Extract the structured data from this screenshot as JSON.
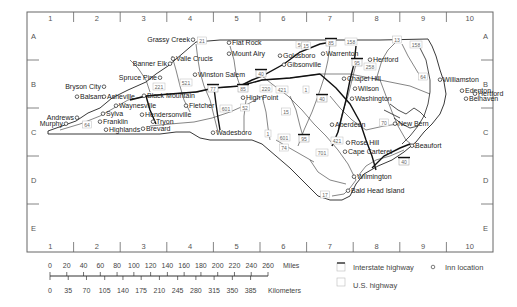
{
  "map": {
    "title": "North Carolina inn locations",
    "columns": [
      "1",
      "2",
      "3",
      "4",
      "5",
      "6",
      "7",
      "8",
      "9",
      "10"
    ],
    "rows": [
      "A",
      "B",
      "C",
      "D",
      "E"
    ],
    "places": [
      {
        "name": "Grassy Creek",
        "x": 190,
        "y": 42,
        "anchor": "end"
      },
      {
        "name": "Flat Rock",
        "x": 232,
        "y": 45,
        "anchor": "start"
      },
      {
        "name": "Mount Airy",
        "x": 232,
        "y": 56,
        "anchor": "start"
      },
      {
        "name": "Valle Crucis",
        "x": 176,
        "y": 61,
        "anchor": "start"
      },
      {
        "name": "Banner Elk",
        "x": 167,
        "y": 66,
        "anchor": "end"
      },
      {
        "name": "Goldsboro",
        "x": 283,
        "y": 58,
        "anchor": "start"
      },
      {
        "name": "Gibsonville",
        "x": 287,
        "y": 67,
        "anchor": "start"
      },
      {
        "name": "Warrenton",
        "x": 326,
        "y": 56,
        "anchor": "start"
      },
      {
        "name": "Hertford",
        "x": 373,
        "y": 62,
        "anchor": "start"
      },
      {
        "name": "Spruce Pine",
        "x": 157,
        "y": 80,
        "anchor": "end"
      },
      {
        "name": "Winston Salem",
        "x": 198,
        "y": 77,
        "anchor": "start"
      },
      {
        "name": "Chapel Hill",
        "x": 347,
        "y": 81,
        "anchor": "start"
      },
      {
        "name": "Williamston",
        "x": 443,
        "y": 82,
        "anchor": "start"
      },
      {
        "name": "Bryson City",
        "x": 101,
        "y": 89,
        "anchor": "end"
      },
      {
        "name": "Wilson",
        "x": 358,
        "y": 91,
        "anchor": "start"
      },
      {
        "name": "Balsam",
        "x": 80,
        "y": 99,
        "anchor": "start"
      },
      {
        "name": "Asheville",
        "x": 107,
        "y": 99,
        "anchor": "start"
      },
      {
        "name": "Black Mountain",
        "x": 147,
        "y": 98,
        "anchor": "start"
      },
      {
        "name": "High Point",
        "x": 246,
        "y": 100,
        "anchor": "start"
      },
      {
        "name": "Edenton",
        "x": 465,
        "y": 93,
        "anchor": "start"
      },
      {
        "name": "Hertford",
        "x": 478,
        "y": 96,
        "anchor": "start"
      },
      {
        "name": "Washington",
        "x": 355,
        "y": 101,
        "anchor": "start"
      },
      {
        "name": "Belhaven",
        "x": 469,
        "y": 101,
        "anchor": "start"
      },
      {
        "name": "Waynesville",
        "x": 119,
        "y": 108,
        "anchor": "start"
      },
      {
        "name": "Fletcher",
        "x": 189,
        "y": 108,
        "anchor": "start"
      },
      {
        "name": "Sylva",
        "x": 106,
        "y": 116,
        "anchor": "start"
      },
      {
        "name": "Hendersonville",
        "x": 145,
        "y": 117,
        "anchor": "start"
      },
      {
        "name": "Andrews",
        "x": 74,
        "y": 120,
        "anchor": "end"
      },
      {
        "name": "Franklin",
        "x": 103,
        "y": 124,
        "anchor": "start"
      },
      {
        "name": "Tryon",
        "x": 156,
        "y": 124,
        "anchor": "start"
      },
      {
        "name": "Murphy",
        "x": 63,
        "y": 126,
        "anchor": "end"
      },
      {
        "name": "Highlands",
        "x": 109,
        "y": 132,
        "anchor": "start"
      },
      {
        "name": "Brevard",
        "x": 146,
        "y": 131,
        "anchor": "start"
      },
      {
        "name": "Wadesboro",
        "x": 216,
        "y": 135,
        "anchor": "start"
      },
      {
        "name": "Aberdeen",
        "x": 335,
        "y": 127,
        "anchor": "start"
      },
      {
        "name": "New Bern",
        "x": 398,
        "y": 126,
        "anchor": "start"
      },
      {
        "name": "Rose Hill",
        "x": 351,
        "y": 145,
        "anchor": "start"
      },
      {
        "name": "Beaufort",
        "x": 415,
        "y": 148,
        "anchor": "start"
      },
      {
        "name": "Cape Carteret",
        "x": 348,
        "y": 154,
        "anchor": "start"
      },
      {
        "name": "Wilmington",
        "x": 357,
        "y": 179,
        "anchor": "start"
      },
      {
        "name": "Bald Head Island",
        "x": 351,
        "y": 193,
        "anchor": "start"
      }
    ],
    "us_highways": [
      {
        "num": "21",
        "x": 202,
        "y": 41
      },
      {
        "num": "501",
        "x": 302,
        "y": 45
      },
      {
        "num": "15",
        "x": 306,
        "y": 46
      },
      {
        "num": "158",
        "x": 351,
        "y": 42
      },
      {
        "num": "13",
        "x": 397,
        "y": 40
      },
      {
        "num": "158",
        "x": 416,
        "y": 45
      },
      {
        "num": "258",
        "x": 370,
        "y": 67
      },
      {
        "num": "64",
        "x": 423,
        "y": 77
      },
      {
        "num": "221",
        "x": 159,
        "y": 87
      },
      {
        "num": "521",
        "x": 186,
        "y": 83
      },
      {
        "num": "220",
        "x": 266,
        "y": 89
      },
      {
        "num": "421",
        "x": 282,
        "y": 90
      },
      {
        "num": "1",
        "x": 306,
        "y": 90
      },
      {
        "num": "601",
        "x": 226,
        "y": 109
      },
      {
        "num": "52",
        "x": 245,
        "y": 108
      },
      {
        "num": "15",
        "x": 286,
        "y": 112
      },
      {
        "num": "1",
        "x": 268,
        "y": 134
      },
      {
        "num": "601",
        "x": 284,
        "y": 138
      },
      {
        "num": "74",
        "x": 284,
        "y": 148
      },
      {
        "num": "421",
        "x": 337,
        "y": 141
      },
      {
        "num": "701",
        "x": 322,
        "y": 153
      },
      {
        "num": "70",
        "x": 384,
        "y": 123
      },
      {
        "num": "64",
        "x": 87,
        "y": 125
      },
      {
        "num": "17",
        "x": 325,
        "y": 195
      }
    ],
    "interstates": [
      {
        "num": "85",
        "x": 331,
        "y": 43
      },
      {
        "num": "95",
        "x": 357,
        "y": 63
      },
      {
        "num": "77",
        "x": 213,
        "y": 89
      },
      {
        "num": "85",
        "x": 243,
        "y": 89
      },
      {
        "num": "40",
        "x": 261,
        "y": 74
      },
      {
        "num": "40",
        "x": 322,
        "y": 99
      },
      {
        "num": "95",
        "x": 304,
        "y": 139
      },
      {
        "num": "40",
        "x": 404,
        "y": 162
      }
    ]
  },
  "scale": {
    "miles_ticks": [
      "0",
      "20",
      "40",
      "60",
      "80",
      "100",
      "120",
      "140",
      "160",
      "180",
      "200",
      "220",
      "240",
      "260"
    ],
    "miles_label": "Miles",
    "km_ticks": [
      "0",
      "35",
      "70",
      "105",
      "140",
      "175",
      "210",
      "245",
      "280",
      "315",
      "350",
      "385"
    ],
    "km_label": "Kilometers"
  },
  "legend": {
    "interstate_label": "Interstate highway",
    "us_label": "U.S. highway",
    "inn_label": "Inn location",
    "shield_text": "nn"
  }
}
